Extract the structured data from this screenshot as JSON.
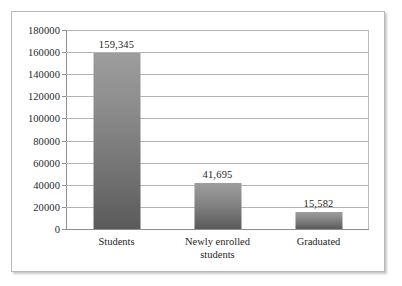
{
  "figure": {
    "background_color": "#ffffff",
    "frame_border_color": "#b9b9b9"
  },
  "chart_data": {
    "type": "bar",
    "title": "",
    "subtitle": "",
    "xlabel": "",
    "ylabel": "",
    "categories": [
      "Students",
      "Newly enrolled students",
      "Graduated"
    ],
    "category_lines": [
      [
        "Students"
      ],
      [
        "Newly enrolled",
        "students"
      ],
      [
        "Graduated"
      ]
    ],
    "values": [
      159345,
      41695,
      15582
    ],
    "value_labels": [
      "159,345",
      "41,695",
      "15,582"
    ],
    "ylim": [
      0,
      180000
    ],
    "ytick_step": 20000,
    "yticks": [
      180000,
      160000,
      140000,
      120000,
      100000,
      80000,
      60000,
      40000,
      20000,
      0
    ],
    "ytick_labels": [
      "180000",
      "160000",
      "140000",
      "120000",
      "100000",
      "80000",
      "60000",
      "40000",
      "20000",
      "0"
    ],
    "grid": true,
    "grid_axis": "y",
    "grid_color": "#b4b4b4",
    "legend": false,
    "legend_position": "none",
    "bar_fill_top_color": "#9d9d9d",
    "bar_fill_bottom_color": "#5a5a5a",
    "axis_line_color": "#8f8f8f",
    "text_color": "#1d1f21"
  }
}
